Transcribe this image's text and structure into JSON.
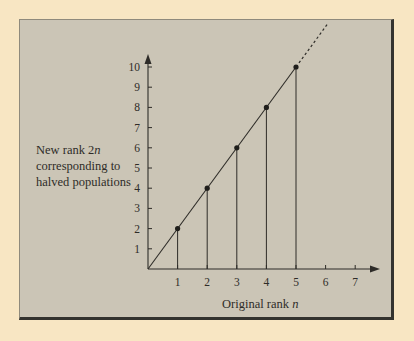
{
  "chart_data": {
    "type": "line",
    "title": "",
    "xlabel": "Original rank n",
    "ylabel": "New rank 2n corresponding to halved populations",
    "x_ticks": [
      1,
      2,
      3,
      4,
      5,
      6,
      7
    ],
    "y_ticks": [
      1,
      2,
      3,
      4,
      5,
      6,
      7,
      8,
      9,
      10
    ],
    "xlim": [
      0,
      7.5
    ],
    "ylim": [
      0,
      10.5
    ],
    "series": [
      {
        "name": "New rank 2n",
        "x": [
          1,
          2,
          3,
          4,
          5
        ],
        "y": [
          2,
          4,
          6,
          8,
          10
        ],
        "style": "solid line through origin with dots and vertical drop lines; dashed extension beyond n=5"
      }
    ],
    "grid": false,
    "legend": "none"
  },
  "labels": {
    "y_line1_prefix": "New rank 2",
    "y_line1_var": "n",
    "y_line2": "corresponding to",
    "y_line3": "halved populations",
    "x_prefix": "Original rank ",
    "x_var": "n"
  },
  "colors": {
    "background": "#f8e6c3",
    "panel": "#cbc5b6",
    "ink": "#2e2c28"
  }
}
